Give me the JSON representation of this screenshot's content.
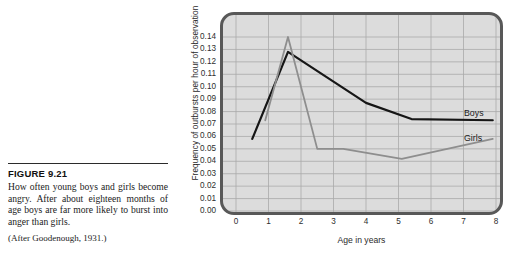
{
  "figure": {
    "label": "FIGURE 9.21",
    "caption": "How often young boys and girls become angry. After about eighteen months of age boys are far more likely to burst into anger than girls.",
    "source": "(After Goodenough, 1931.)"
  },
  "chart_data": {
    "type": "line",
    "title": "",
    "xlabel": "Age in years",
    "ylabel": "Frequency of outbursts per hour of observation",
    "xlim": [
      0,
      8
    ],
    "ylim": [
      0,
      0.14
    ],
    "grid": true,
    "legend_position": "right-inline",
    "xticks": [
      "0",
      "1",
      "2",
      "3",
      "4",
      "5",
      "6",
      "7",
      "8"
    ],
    "yticks": [
      "0.14",
      "0.13",
      "0.12",
      "0.11",
      "0.10",
      "0.09",
      "0.08",
      "0.07",
      "0.06",
      "0.05",
      "0.04",
      "0.03",
      "0.02",
      "0.01",
      "0.00"
    ],
    "series": [
      {
        "name": "Boys",
        "color": "#161616",
        "x": [
          0.5,
          1.6,
          4.0,
          5.4,
          7.9
        ],
        "values": [
          0.058,
          0.128,
          0.087,
          0.074,
          0.073
        ]
      },
      {
        "name": "Girls",
        "color": "#8e8e8e",
        "x": [
          0.9,
          1.6,
          2.5,
          3.3,
          5.1,
          7.9
        ],
        "values": [
          0.073,
          0.14,
          0.05,
          0.05,
          0.042,
          0.058
        ]
      }
    ]
  }
}
